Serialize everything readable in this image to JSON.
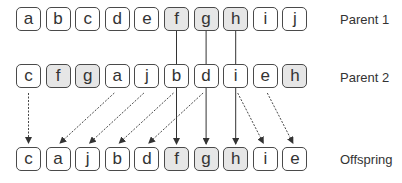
{
  "diagram": {
    "colors": {
      "highlight": "#e6e6e6",
      "border": "#4a4a4a",
      "text": "#333333",
      "line": "#333333"
    },
    "rows": [
      {
        "label": "Parent 1",
        "cells": [
          {
            "v": "a",
            "hl": false
          },
          {
            "v": "b",
            "hl": false
          },
          {
            "v": "c",
            "hl": false
          },
          {
            "v": "d",
            "hl": false
          },
          {
            "v": "e",
            "hl": false
          },
          {
            "v": "f",
            "hl": true
          },
          {
            "v": "g",
            "hl": true
          },
          {
            "v": "h",
            "hl": true
          },
          {
            "v": "i",
            "hl": false
          },
          {
            "v": "j",
            "hl": false
          }
        ]
      },
      {
        "label": "Parent 2",
        "cells": [
          {
            "v": "c",
            "hl": false
          },
          {
            "v": "f",
            "hl": true
          },
          {
            "v": "g",
            "hl": true
          },
          {
            "v": "a",
            "hl": false
          },
          {
            "v": "j",
            "hl": false
          },
          {
            "v": "b",
            "hl": false
          },
          {
            "v": "d",
            "hl": false
          },
          {
            "v": "i",
            "hl": false
          },
          {
            "v": "e",
            "hl": false
          },
          {
            "v": "h",
            "hl": true
          }
        ]
      },
      {
        "label": "Offspring",
        "cells": [
          {
            "v": "c",
            "hl": false
          },
          {
            "v": "a",
            "hl": false
          },
          {
            "v": "j",
            "hl": false
          },
          {
            "v": "b",
            "hl": false
          },
          {
            "v": "d",
            "hl": false
          },
          {
            "v": "f",
            "hl": true
          },
          {
            "v": "g",
            "hl": true
          },
          {
            "v": "h",
            "hl": true
          },
          {
            "v": "i",
            "hl": false
          },
          {
            "v": "e",
            "hl": false
          }
        ]
      }
    ],
    "solid_links": [
      5,
      6,
      7
    ],
    "dashed_links": [
      {
        "from": 0,
        "to": 0
      },
      {
        "from": 3,
        "to": 1
      },
      {
        "from": 4,
        "to": 2
      },
      {
        "from": 5,
        "to": 3
      },
      {
        "from": 6,
        "to": 4
      },
      {
        "from": 7,
        "to": 8
      },
      {
        "from": 8,
        "to": 9
      }
    ]
  }
}
